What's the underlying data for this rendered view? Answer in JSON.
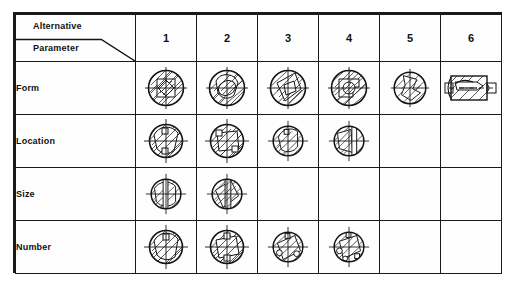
{
  "figure": {
    "kind": "morphological-matrix",
    "corner": {
      "top_label": "Alternative",
      "bottom_label": "Parameter"
    },
    "columns": [
      "1",
      "2",
      "3",
      "4",
      "5",
      "6"
    ],
    "rows": [
      {
        "label": "Form",
        "cells": [
          {
            "col": "1",
            "filled": true,
            "sketch": "hatched-circle-section"
          },
          {
            "col": "2",
            "filled": true,
            "sketch": "hatched-circle-section"
          },
          {
            "col": "3",
            "filled": true,
            "sketch": "hatched-circle-section"
          },
          {
            "col": "4",
            "filled": true,
            "sketch": "hatched-circle-section"
          },
          {
            "col": "5",
            "filled": true,
            "sketch": "hatched-circle-section"
          },
          {
            "col": "6",
            "filled": true,
            "sketch": "hatched-shaft-side-view"
          }
        ]
      },
      {
        "label": "Location",
        "cells": [
          {
            "col": "1",
            "filled": true,
            "sketch": "hatched-circle-with-centerlines"
          },
          {
            "col": "2",
            "filled": true,
            "sketch": "hatched-circle-with-centerlines"
          },
          {
            "col": "3",
            "filled": true,
            "sketch": "hatched-circle-with-centerlines"
          },
          {
            "col": "4",
            "filled": true,
            "sketch": "hatched-circle-with-centerlines"
          },
          {
            "col": "5",
            "filled": false,
            "sketch": null
          },
          {
            "col": "6",
            "filled": false,
            "sketch": null
          }
        ]
      },
      {
        "label": "Size",
        "cells": [
          {
            "col": "1",
            "filled": true,
            "sketch": "hatched-circle-with-centerlines"
          },
          {
            "col": "2",
            "filled": true,
            "sketch": "hatched-circle-with-centerlines"
          },
          {
            "col": "3",
            "filled": false,
            "sketch": null
          },
          {
            "col": "4",
            "filled": false,
            "sketch": null
          },
          {
            "col": "5",
            "filled": false,
            "sketch": null
          },
          {
            "col": "6",
            "filled": false,
            "sketch": null
          }
        ]
      },
      {
        "label": "Number",
        "cells": [
          {
            "col": "1",
            "filled": true,
            "sketch": "hatched-circle-with-centerlines"
          },
          {
            "col": "2",
            "filled": true,
            "sketch": "hatched-circle-with-centerlines"
          },
          {
            "col": "3",
            "filled": true,
            "sketch": "hatched-circle-with-centerlines"
          },
          {
            "col": "4",
            "filled": true,
            "sketch": "hatched-circle-with-centerlines"
          },
          {
            "col": "5",
            "filled": false,
            "sketch": null
          },
          {
            "col": "6",
            "filled": false,
            "sketch": null
          }
        ]
      }
    ],
    "colors": {
      "line": "#141414",
      "border": "#1a1a1a",
      "page_background": "#ffffff",
      "cell_background": "#fefefe",
      "text": "#111111"
    }
  }
}
